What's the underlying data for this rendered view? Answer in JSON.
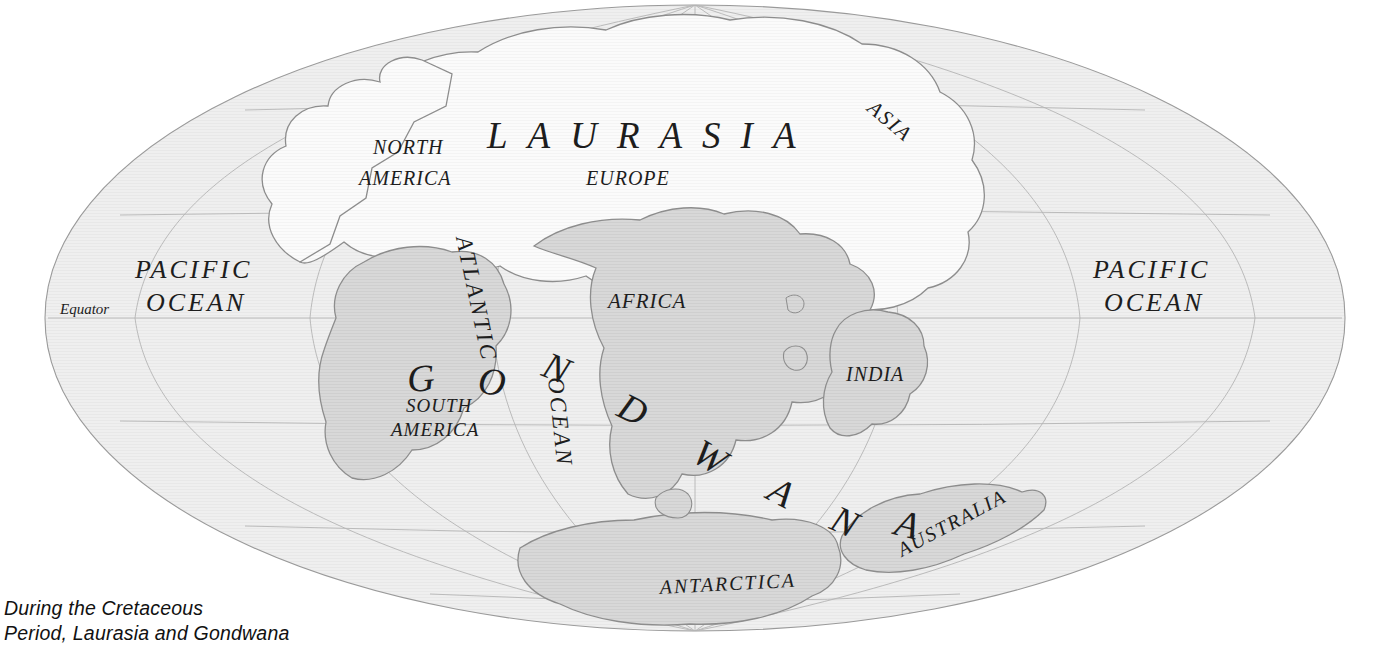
{
  "map": {
    "title": "Cretaceous paleogeographic world map",
    "projection": "mollweide-elliptical",
    "colors": {
      "background": "#ffffff",
      "ocean": "#efefef",
      "ocean_outline": "#9a9a9a",
      "laurasia_fill": "#fbfbfb",
      "gondwana_fill": "#d8d8d8",
      "coastline": "#8d8d8d",
      "graticule": "#b4b4b4",
      "label": "#1d1d1d"
    },
    "ellipse": {
      "cx": 695,
      "cy": 318,
      "rx": 650,
      "ry": 313
    },
    "equator_label": "Equator",
    "supercontinents": [
      {
        "name": "LAURASIA",
        "letters": [
          "L",
          "A",
          "U",
          "R",
          "A",
          "S",
          "I",
          "A"
        ]
      },
      {
        "name": "GONDWANA",
        "letters": [
          "G",
          "O",
          "N",
          "D",
          "W",
          "A",
          "N",
          "A"
        ]
      }
    ],
    "ocean_labels": [
      {
        "text_line1": "PACIFIC",
        "text_line2": "OCEAN",
        "side": "west"
      },
      {
        "text_line1": "PACIFIC",
        "text_line2": "OCEAN",
        "side": "east"
      },
      {
        "text_line1": "ATLANTIC",
        "text_line2": "OCEAN",
        "side": "center"
      }
    ],
    "region_labels": [
      {
        "id": "north-america",
        "line1": "NORTH",
        "line2": "AMERICA"
      },
      {
        "id": "europe",
        "line1": "EUROPE",
        "line2": ""
      },
      {
        "id": "asia",
        "line1": "ASIA",
        "line2": ""
      },
      {
        "id": "africa",
        "line1": "AFRICA",
        "line2": ""
      },
      {
        "id": "india",
        "line1": "INDIA",
        "line2": ""
      },
      {
        "id": "south-america",
        "line1": "SOUTH",
        "line2": "AMERICA"
      },
      {
        "id": "australia",
        "line1": "AUSTRALIA",
        "line2": ""
      },
      {
        "id": "antarctica",
        "line1": "ANTARCTICA",
        "line2": ""
      }
    ]
  },
  "caption": {
    "line1": "During the Cretaceous",
    "line2": "Period, Laurasia and Gondwana"
  }
}
